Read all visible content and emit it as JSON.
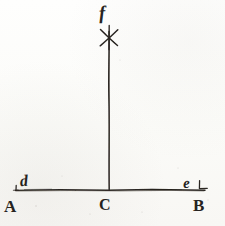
{
  "figure": {
    "background_color": "#fdfdfb",
    "ink_color": "#262320",
    "canvas": {
      "width": 225,
      "height": 226
    },
    "points": [
      {
        "id": "A",
        "label": "A",
        "style": "capital-serif",
        "x": 16,
        "y": 190,
        "label_x": 4,
        "label_y": 198
      },
      {
        "id": "C",
        "label": "C",
        "style": "capital-serif",
        "x": 109,
        "y": 190,
        "label_x": 99,
        "label_y": 197
      },
      {
        "id": "B",
        "label": "B",
        "style": "capital-serif",
        "x": 204,
        "y": 190,
        "label_x": 193,
        "label_y": 197
      },
      {
        "id": "d",
        "label": "d",
        "style": "italic-lowercase",
        "x": 20,
        "y": 188,
        "label_x": 20,
        "label_y": 173
      },
      {
        "id": "e",
        "label": "e",
        "style": "italic-lowercase",
        "x": 196,
        "y": 188,
        "label_x": 183,
        "label_y": 176
      },
      {
        "id": "f",
        "label": "f",
        "style": "italic-lowercase",
        "x": 109,
        "y": 37,
        "label_x": 99,
        "label_y": 3
      }
    ],
    "lines": [
      {
        "id": "baseline-AB",
        "from": "A",
        "to": "B",
        "orientation": "horizontal",
        "x1": 15,
        "y1": 190,
        "x2": 205,
        "y2": 190
      },
      {
        "id": "perpendicular-Cf",
        "from": "C",
        "to": "f",
        "orientation": "vertical",
        "x1": 109,
        "y1": 189,
        "x2": 109,
        "y2": 31
      }
    ],
    "marks": [
      {
        "id": "arc-mark-f",
        "shape": "asterisk-cross",
        "x": 109,
        "y": 36,
        "note": "intersection arcs crossing at f"
      },
      {
        "id": "tick-mark-d",
        "shape": "small-tick",
        "x": 16,
        "y": 186
      },
      {
        "id": "tick-mark-e",
        "shape": "small-corner-tick",
        "x": 200,
        "y": 185
      }
    ]
  }
}
